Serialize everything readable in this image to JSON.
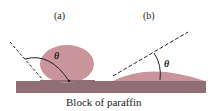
{
  "labels": {
    "a": "(a)",
    "b": "(b)",
    "theta_a": "θ",
    "theta_b": "θ"
  },
  "caption": "Block of paraffin",
  "colors": {
    "drop": "#c9959a",
    "block": "#8f6f75",
    "line": "#222222"
  }
}
